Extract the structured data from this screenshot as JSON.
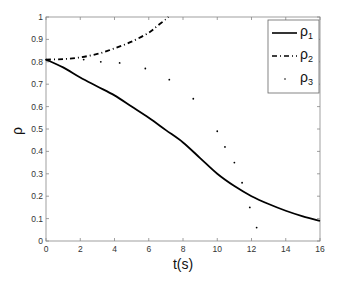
{
  "chart_data": {
    "type": "line",
    "title": "",
    "xlabel": "t(s)",
    "ylabel": "ρ",
    "xlim": [
      0,
      16
    ],
    "ylim": [
      0,
      1
    ],
    "xticks": [
      "0",
      "2",
      "4",
      "6",
      "8",
      "10",
      "12",
      "14",
      "16"
    ],
    "yticks": [
      "0",
      "0.1",
      "0.2",
      "0.3",
      "0.4",
      "0.5",
      "0.6",
      "0.7",
      "0.8",
      "0.9",
      "1"
    ],
    "grid": false,
    "legend_position": "upper right",
    "series": [
      {
        "name": "ρ1",
        "style": "solid",
        "x": [
          0,
          1,
          2,
          3,
          4,
          5,
          6,
          7,
          8,
          9,
          10,
          11,
          12,
          13,
          14,
          15,
          16
        ],
        "y": [
          0.81,
          0.775,
          0.73,
          0.69,
          0.65,
          0.6,
          0.55,
          0.495,
          0.44,
          0.37,
          0.3,
          0.245,
          0.2,
          0.165,
          0.135,
          0.11,
          0.09
        ]
      },
      {
        "name": "ρ2",
        "style": "dash-dot",
        "x": [
          0,
          1,
          2,
          3,
          4,
          5,
          6,
          6.5,
          7,
          7.15
        ],
        "y": [
          0.81,
          0.812,
          0.82,
          0.835,
          0.86,
          0.89,
          0.93,
          0.96,
          0.99,
          1.0
        ]
      },
      {
        "name": "ρ3",
        "style": "points",
        "x": [
          0,
          2.2,
          3.2,
          4.3,
          5.8,
          7.2,
          8.6,
          10.0,
          10.45,
          11.0,
          11.45,
          11.9,
          12.3
        ],
        "y": [
          0.81,
          0.81,
          0.8,
          0.795,
          0.77,
          0.72,
          0.635,
          0.49,
          0.42,
          0.35,
          0.26,
          0.15,
          0.06
        ]
      }
    ]
  },
  "legend": {
    "items": [
      {
        "base": "ρ",
        "sub": "1"
      },
      {
        "base": "ρ",
        "sub": "2"
      },
      {
        "base": "ρ",
        "sub": "3"
      }
    ]
  }
}
